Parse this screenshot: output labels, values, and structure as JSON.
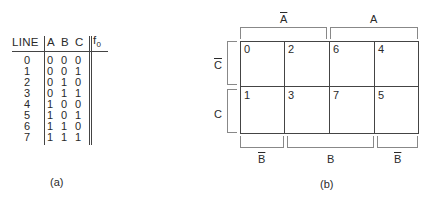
{
  "truth_table": {
    "headers": {
      "line": "LINE",
      "a": "A",
      "b": "B",
      "c": "C",
      "f": "f",
      "f_sub": "0"
    },
    "rows": [
      {
        "line": "0",
        "a": "0",
        "b": "0",
        "c": "0"
      },
      {
        "line": "1",
        "a": "0",
        "b": "0",
        "c": "1"
      },
      {
        "line": "2",
        "a": "0",
        "b": "1",
        "c": "0"
      },
      {
        "line": "3",
        "a": "0",
        "b": "1",
        "c": "1"
      },
      {
        "line": "4",
        "a": "1",
        "b": "0",
        "c": "0"
      },
      {
        "line": "5",
        "a": "1",
        "b": "0",
        "c": "1"
      },
      {
        "line": "6",
        "a": "1",
        "b": "1",
        "c": "0"
      },
      {
        "line": "7",
        "a": "1",
        "b": "1",
        "c": "1"
      }
    ],
    "caption": "(a)"
  },
  "kmap": {
    "top_labels": {
      "a_bar": "A",
      "a": "A"
    },
    "left_labels": {
      "c_bar": "C",
      "c": "C"
    },
    "bottom_labels": {
      "b_bar_left": "B",
      "b": "B",
      "b_bar_right": "B"
    },
    "cells": [
      [
        "0",
        "2",
        "6",
        "4"
      ],
      [
        "1",
        "3",
        "7",
        "5"
      ]
    ],
    "caption": "(b)"
  }
}
